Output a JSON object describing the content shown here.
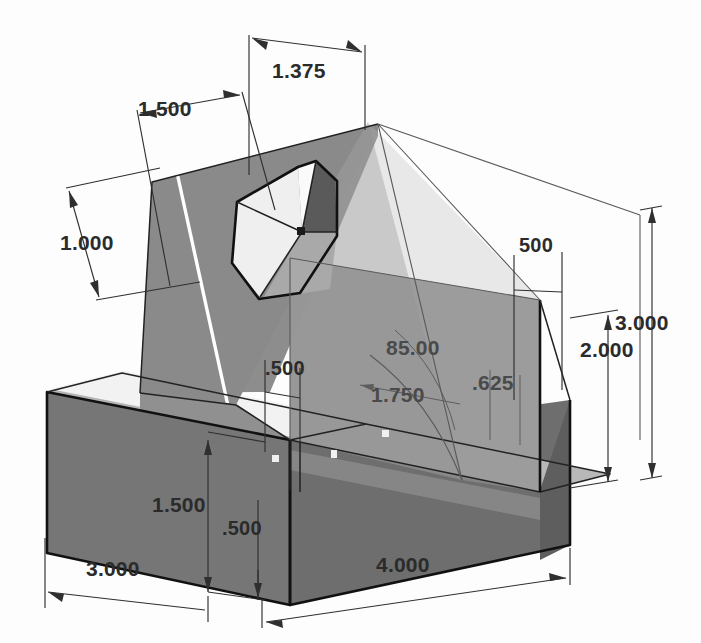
{
  "drawing": {
    "title": "Isometric dimensioned part view",
    "units": "inches",
    "background_color": "#fdfdfd"
  },
  "palette": {
    "face_wedge_left": "#8d8d8d",
    "face_wedge_front": "#8a8a8a",
    "face_base_front": "#767676",
    "face_base_top": "#b4b4b4",
    "face_base_right_dark": "#5e5e5e",
    "face_hole_light": "#eeeeee",
    "face_hole_mid": "#a9a9a9",
    "face_hole_dark": "#5a5a5a",
    "ghost_overlay": "#9a9a9a",
    "edge_color": "#111111",
    "highlight_color": "#ffffff",
    "dim_color": "#2b2b2b"
  },
  "dimensions": [
    {
      "id": "d-1375",
      "label": "1.375",
      "x": 300,
      "y": 68,
      "kind": "linear"
    },
    {
      "id": "d-1500-top",
      "label": "1.500",
      "x": 163,
      "y": 106,
      "kind": "linear"
    },
    {
      "id": "d-1000",
      "label": "1.000",
      "x": 98,
      "y": 242,
      "kind": "linear"
    },
    {
      "id": "d-500-upper",
      "label": ".500",
      "x": 290,
      "y": 368,
      "kind": "linear"
    },
    {
      "id": "d-500-right",
      "label": "500",
      "x": 538,
      "y": 245,
      "kind": "linear"
    },
    {
      "id": "d-8500",
      "label": "85.00",
      "x": 410,
      "y": 348,
      "kind": "angle"
    },
    {
      "id": "d-1750",
      "label": "1.750",
      "x": 398,
      "y": 395,
      "kind": "linear"
    },
    {
      "id": "d-625",
      "label": ".625",
      "x": 493,
      "y": 390,
      "kind": "linear"
    },
    {
      "id": "d-2000",
      "label": "2.000",
      "x": 592,
      "y": 348,
      "kind": "linear"
    },
    {
      "id": "d-3000-right",
      "label": "3.000",
      "x": 624,
      "y": 323,
      "kind": "linear"
    },
    {
      "id": "d-1500-left",
      "label": "1.500",
      "x": 186,
      "y": 505,
      "kind": "linear"
    },
    {
      "id": "d-500-lower",
      "label": ".500",
      "x": 240,
      "y": 528,
      "kind": "linear"
    },
    {
      "id": "d-3000-bottom",
      "label": "3.000",
      "x": 132,
      "y": 565,
      "kind": "linear"
    },
    {
      "id": "d-4000",
      "label": "4.000",
      "x": 410,
      "y": 562,
      "kind": "linear"
    }
  ],
  "features": {
    "pentagon_hole": "pentagonal through-pocket on angled wedge face",
    "base_slab": "rectangular base plate",
    "wedge": "triangular vertical rib"
  }
}
